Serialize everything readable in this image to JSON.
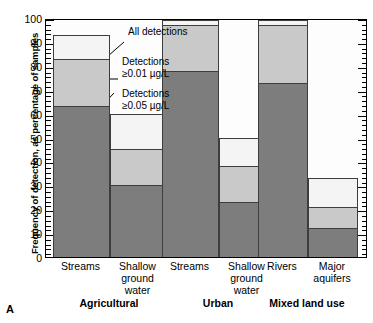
{
  "panel": {
    "letter": "A"
  },
  "chart_data": {
    "type": "bar",
    "title": "",
    "xlabel": "",
    "ylabel": "Frequency of detection, as percentage of samples",
    "ylim": [
      0,
      100
    ],
    "ytick_step": 10,
    "yticks": [
      0,
      10,
      20,
      30,
      40,
      50,
      60,
      70,
      80,
      90,
      100
    ],
    "minor_tick_step": 2,
    "grid": false,
    "stacked": "overlay",
    "legend_position": "inside-upper-left",
    "series": [
      {
        "name": "All detections",
        "key": "all",
        "color": "#f4f4f4",
        "values": [
          93,
          60,
          99,
          50,
          99,
          33
        ]
      },
      {
        "name": "Detections ≥0.01 µg/L",
        "key": "d001",
        "color": "#c9c9c9",
        "values": [
          83,
          45,
          97,
          38,
          97,
          21
        ]
      },
      {
        "name": "Detections ≥0.05 µg/L",
        "key": "d005",
        "color": "#7d7d7d",
        "values": [
          63,
          30,
          78,
          23,
          73,
          12
        ]
      }
    ],
    "categories": [
      {
        "label": "Streams",
        "group": "Agricultural"
      },
      {
        "label": "Shallow\nground\nwater",
        "group": "Agricultural"
      },
      {
        "label": "Streams",
        "group": "Urban"
      },
      {
        "label": "Shallow\nground\nwater",
        "group": "Urban"
      },
      {
        "label": "Rivers",
        "group": "Mixed land use"
      },
      {
        "label": "Major\naquifers",
        "group": "Mixed land use"
      }
    ],
    "groups": [
      "Agricultural",
      "Urban",
      "Mixed land use"
    ],
    "annotations": [
      {
        "text": "All detections",
        "target": "all"
      },
      {
        "text": "Detections\n≥0.01 µg/L",
        "target": "d001"
      },
      {
        "text": "Detections\n≥0.05 µg/L",
        "target": "d005"
      }
    ]
  },
  "axis": {
    "y_labels": [
      "100",
      "90",
      "80",
      "70",
      "60",
      "50",
      "40",
      "30",
      "20",
      "10",
      "0"
    ],
    "y_title": "Frequency of detection, as percentage of samples"
  },
  "xaxis": {
    "cats": [
      {
        "l1": "Streams",
        "l2": "",
        "l3": ""
      },
      {
        "l1": "Shallow",
        "l2": "ground",
        "l3": "water"
      },
      {
        "l1": "Streams",
        "l2": "",
        "l3": ""
      },
      {
        "l1": "Shallow",
        "l2": "ground",
        "l3": "water"
      },
      {
        "l1": "Rivers",
        "l2": "",
        "l3": ""
      },
      {
        "l1": "Major",
        "l2": "aquifers",
        "l3": ""
      }
    ],
    "groups": [
      {
        "label": "Agricultural"
      },
      {
        "label": "Urban"
      },
      {
        "label": "Mixed land use"
      }
    ]
  },
  "legend": {
    "all": "All detections",
    "d001_line1": "Detections",
    "d001_line2": "≥0.01 µg/L",
    "d005_line1": "Detections",
    "d005_line2": "≥0.05 µg/L"
  }
}
